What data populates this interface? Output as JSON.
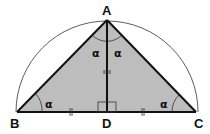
{
  "diagram": {
    "colors": {
      "fill": "#bdbdbd",
      "stroke": "#111111",
      "background": "#ffffff",
      "arc": "#333333"
    },
    "points": {
      "A": {
        "label": "A",
        "x": 107,
        "y": 20
      },
      "B": {
        "label": "B",
        "x": 17,
        "y": 112
      },
      "C": {
        "label": "C",
        "x": 196,
        "y": 112
      },
      "D": {
        "label": "D",
        "x": 107,
        "y": 112
      }
    },
    "angles": {
      "at_B": "α",
      "at_C": "α",
      "at_A_left": "α",
      "at_A_right": "α"
    },
    "marks": {
      "right_angle_at": "D",
      "equal_segments": [
        "BD",
        "DC",
        "AD"
      ]
    }
  }
}
